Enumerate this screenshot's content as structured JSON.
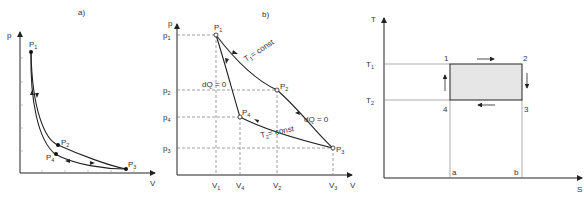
{
  "panels": [
    {
      "id": "a",
      "caption": "a)",
      "y_axis_label": "p",
      "x_axis_label": "V",
      "points": [
        "P1",
        "P2",
        "P3",
        "P4"
      ],
      "point_labels": {
        "P1": "P",
        "P1_sub": "1",
        "P2": "P",
        "P2_sub": "2",
        "P3": "P",
        "P3_sub": "3",
        "P4": "P",
        "P4_sub": "4"
      }
    },
    {
      "id": "b",
      "caption": "b)",
      "y_axis_label": "p",
      "x_axis_label": "V",
      "y_ticks": [
        {
          "l": "p",
          "s": "1"
        },
        {
          "l": "p",
          "s": "2"
        },
        {
          "l": "p",
          "s": "4"
        },
        {
          "l": "p",
          "s": "3"
        }
      ],
      "x_ticks": [
        {
          "l": "V",
          "s": "1"
        },
        {
          "l": "V",
          "s": "4"
        },
        {
          "l": "V",
          "s": "2"
        },
        {
          "l": "V",
          "s": "3"
        }
      ],
      "point_labels": {
        "P1": "P",
        "P1_sub": "1",
        "P2": "P",
        "P2_sub": "2",
        "P3": "P",
        "P3_sub": "3",
        "P4": "P",
        "P4_sub": "4"
      },
      "annotations": {
        "T1": "T",
        "T1_sub": "1",
        "T1_rest": "= const",
        "T2": "T",
        "T2_sub": "2",
        "T2_rest": "= const",
        "adiabat_left": "dQ = 0",
        "adiabat_right": "dQ = 0"
      }
    },
    {
      "id": "c",
      "y_axis_label": "T",
      "x_axis_label": "S",
      "y_ticks": [
        {
          "l": "T",
          "s": "1"
        },
        {
          "l": "T",
          "s": "2"
        }
      ],
      "x_ticks": [
        "a",
        "b"
      ],
      "corners": [
        "1",
        "2",
        "3",
        "4"
      ],
      "fill_color": "#e6e6e6"
    }
  ]
}
